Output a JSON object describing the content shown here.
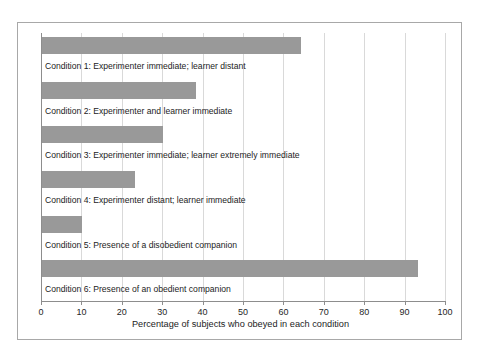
{
  "chart_data": {
    "type": "bar",
    "orientation": "horizontal",
    "title": "",
    "xlabel": "Percentage of subjects who obeyed in each condition",
    "ylabel": "",
    "xlim": [
      0,
      100
    ],
    "xticks": [
      0,
      10,
      20,
      30,
      40,
      50,
      60,
      70,
      80,
      90,
      100
    ],
    "xtick_labels": [
      "0",
      "10",
      "20",
      "30",
      "40",
      "50",
      "60",
      "70",
      "80",
      "90",
      "100"
    ],
    "grid": "vertical",
    "legend": "none",
    "bar_color": "#999999",
    "categories": [
      "Condition 1: Experimenter immediate; learner distant",
      "Condition 2: Experimenter and learner immediate",
      "Condition 3: Experimenter immediate; learner extremely immediate",
      "Condition 4: Experimenter distant; learner immediate",
      "Condition 5: Presence of a disobedient companion",
      "Condition 6: Presence of an obedient companion"
    ],
    "values": [
      64,
      38,
      30,
      23,
      10,
      93
    ],
    "bars": [
      {
        "label": "Condition 1: Experimenter immediate; learner distant",
        "value": 64
      },
      {
        "label": "Condition 2: Experimenter and learner immediate",
        "value": 38
      },
      {
        "label": "Condition 3: Experimenter immediate; learner extremely immediate",
        "value": 30
      },
      {
        "label": "Condition 4: Experimenter distant; learner immediate",
        "value": 23
      },
      {
        "label": "Condition 5: Presence of a disobedient companion",
        "value": 10
      },
      {
        "label": "Condition 6: Presence of an obedient companion",
        "value": 93
      }
    ]
  }
}
